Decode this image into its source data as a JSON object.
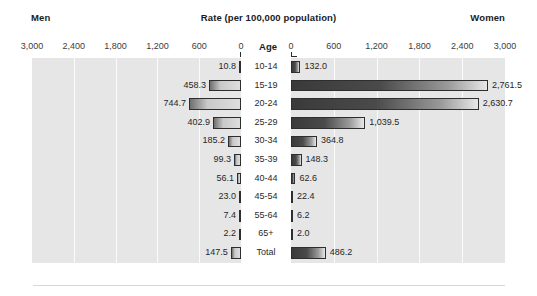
{
  "header": {
    "left_label": "Men",
    "center_title": "Rate (per 100,000 population)",
    "right_label": "Women",
    "age_column_header": "Age"
  },
  "axis": {
    "left_ticks": [
      "3,000",
      "2,400",
      "1,800",
      "1,200",
      "600",
      "0"
    ],
    "right_ticks": [
      "0",
      "600",
      "1,200",
      "1,800",
      "2,400",
      "3,000"
    ]
  },
  "chart_data": {
    "type": "bar",
    "title": "Rate (per 100,000 population)",
    "subtitle": "",
    "xlabel": "Rate (per 100,000 population)",
    "ylabel": "Age",
    "orientation": "horizontal",
    "layout": "population-pyramid",
    "grid": true,
    "legend_position": "top",
    "xlim": [
      0,
      3000
    ],
    "xticks": [
      0,
      600,
      1200,
      1800,
      2400,
      3000
    ],
    "categories": [
      "10-14",
      "15-19",
      "20-24",
      "25-29",
      "30-34",
      "35-39",
      "40-44",
      "45-54",
      "55-64",
      "65+",
      "Total"
    ],
    "series": [
      {
        "name": "Men",
        "side": "left",
        "values": [
          10.8,
          458.3,
          744.7,
          402.9,
          185.2,
          99.3,
          56.1,
          23.0,
          7.4,
          2.2,
          147.5
        ],
        "labels": [
          "10.8",
          "458.3",
          "744.7",
          "402.9",
          "185.2",
          "99.3",
          "56.1",
          "23.0",
          "7.4",
          "2.2",
          "147.5"
        ]
      },
      {
        "name": "Women",
        "side": "right",
        "values": [
          132.0,
          2761.5,
          2630.7,
          1039.5,
          364.8,
          148.3,
          62.6,
          22.4,
          6.2,
          2.0,
          486.2
        ],
        "labels": [
          "132.0",
          "2,761.5",
          "2,630.7",
          "1,039.5",
          "364.8",
          "148.3",
          "62.6",
          "22.4",
          "6.2",
          "2.0",
          "486.2"
        ]
      }
    ]
  },
  "colors": {
    "panel_background": "#e6e6e6",
    "gridline": "#fbfbfb",
    "bar_outline": "#2e2e2e",
    "bar_left_fill": "#c9c9c9",
    "bar_right_fill": "#3a3a3a",
    "text": "#262626"
  }
}
